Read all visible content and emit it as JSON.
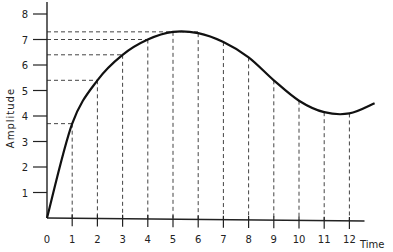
{
  "chart_data": {
    "type": "line",
    "title": "",
    "xlabel": "Time",
    "ylabel": "Amplitude",
    "xlim": [
      0,
      13
    ],
    "ylim": [
      0,
      8
    ],
    "x_ticks": [
      "0",
      "1",
      "2",
      "3",
      "4",
      "5",
      "6",
      "7",
      "8",
      "9",
      "10",
      "11",
      "12"
    ],
    "y_ticks": [
      "1",
      "2",
      "3",
      "4",
      "5",
      "6",
      "7",
      "8"
    ],
    "grid": false,
    "legend": null,
    "series": [
      {
        "name": "Amplitude",
        "x": [
          0,
          1,
          2,
          3,
          4,
          5,
          6,
          7,
          8,
          9,
          10,
          11,
          12,
          13
        ],
        "values": [
          0,
          3.7,
          5.4,
          6.4,
          7.0,
          7.3,
          7.25,
          6.9,
          6.3,
          5.4,
          4.6,
          4.15,
          4.1,
          4.5
        ]
      }
    ],
    "annotations": {
      "sample_lines": "Dashed vertical lines drop from the curve at each integer time 1–12 to the time axis",
      "level_lines": "Dashed horizontal lines connect curve at t=1,2,3,4,5 to the amplitude axis (levels ~3.7, 5.4, 6.4, 7.0, 7.3)"
    },
    "colors": {
      "curve": "#111111",
      "axes": "#222222",
      "dashes": "#444444"
    }
  }
}
